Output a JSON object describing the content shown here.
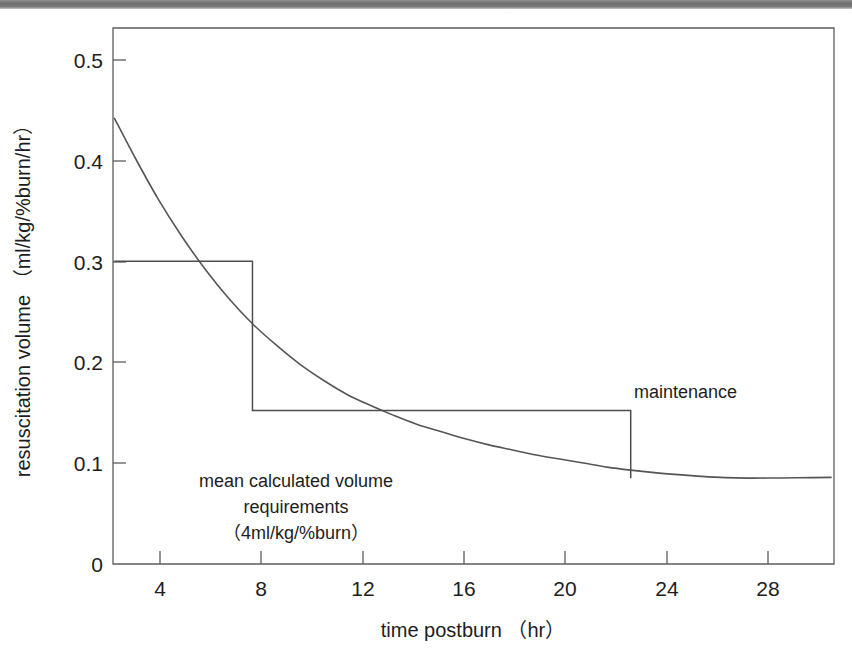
{
  "figure": {
    "background_color": "#ffffff",
    "ink_color": "#1d1d1d",
    "line_color": "#55555a",
    "top_band_color": "#6e6e6e"
  },
  "chart_data": {
    "type": "line",
    "title": "",
    "xlabel": "time postburn （hr）",
    "ylabel": "resuscitation volume （ml/kg/%burn/hr）",
    "xlim": [
      2.1,
      32.6
    ],
    "ylim": [
      0,
      0.531
    ],
    "grid": false,
    "legend": "none",
    "xticks": [
      4,
      8,
      12,
      16,
      20,
      24,
      28
    ],
    "xtick_labels": [
      "4",
      "8",
      "12",
      "16",
      "20",
      "24",
      "28"
    ],
    "yticks": [
      0,
      0.1,
      0.2,
      0.3,
      0.4,
      0.5
    ],
    "ytick_labels": [
      "0",
      "0.1",
      "0.2",
      "0.3",
      "0.4",
      "0.5"
    ],
    "series": [
      {
        "name": "mean calculated volume requirements (4ml/kg/%burn)",
        "kind": "smooth-decay-curve",
        "x": [
          2.15,
          3,
          4,
          5,
          6,
          7,
          8,
          9,
          10,
          11,
          12,
          13,
          14,
          15,
          16,
          17,
          18,
          19,
          20,
          21,
          22,
          23,
          24,
          25,
          26,
          27,
          28,
          29,
          30,
          31,
          32.5
        ],
        "y": [
          0.442,
          0.404,
          0.362,
          0.325,
          0.292,
          0.263,
          0.238,
          0.217,
          0.198,
          0.182,
          0.168,
          0.157,
          0.147,
          0.138,
          0.131,
          0.124,
          0.118,
          0.113,
          0.108,
          0.104,
          0.1,
          0.096,
          0.093,
          0.0905,
          0.0885,
          0.0868,
          0.0856,
          0.0851,
          0.0852,
          0.0854,
          0.0858
        ]
      },
      {
        "name": "maintenance",
        "kind": "step",
        "x": [
          2.15,
          8,
          8,
          24,
          24
        ],
        "y": [
          0.3,
          0.3,
          0.152,
          0.152,
          0.085
        ]
      }
    ],
    "annotations": [
      {
        "name": "maintenance-label",
        "text": "maintenance",
        "x": 22.7,
        "y": 0.175
      },
      {
        "name": "requirements-label-line-1",
        "text": "mean calculated volume",
        "x": 10.3,
        "y": 0.104
      },
      {
        "name": "requirements-label-line-2",
        "text": "requirements",
        "x": 10.3,
        "y": 0.078
      },
      {
        "name": "requirements-label-line-3",
        "text": "（4ml/kg/%burn）",
        "x": 10.3,
        "y": 0.052
      }
    ]
  }
}
